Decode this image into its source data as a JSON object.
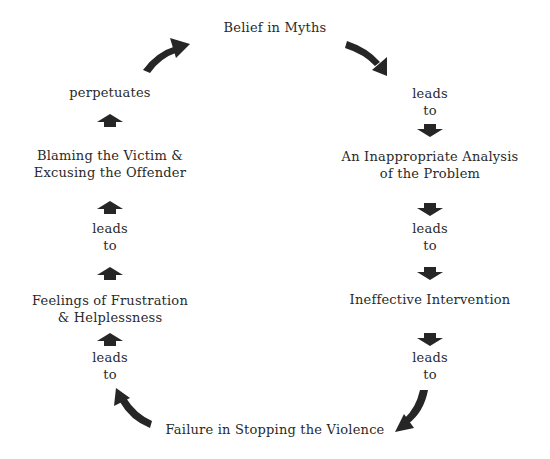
{
  "diagram": {
    "type": "cycle",
    "nodes": [
      {
        "id": "belief",
        "text": "Belief in Myths"
      },
      {
        "id": "analysis",
        "line1": "An Inappropriate Analysis",
        "line2": "of the Problem"
      },
      {
        "id": "intervention",
        "text": "Ineffective Intervention"
      },
      {
        "id": "failure",
        "text": "Failure in Stopping the Violence"
      },
      {
        "id": "frustration",
        "line1": "Feelings of Frustration",
        "line2": "& Helplessness"
      },
      {
        "id": "blaming",
        "line1": "Blaming the Victim &",
        "line2": "Excusing the Offender"
      }
    ],
    "connectors": {
      "right_1": {
        "line1": "leads",
        "line2": "to"
      },
      "right_2": {
        "line1": "leads",
        "line2": "to"
      },
      "right_3": {
        "line1": "leads",
        "line2": "to"
      },
      "left_1": {
        "line1": "leads",
        "line2": "to"
      },
      "left_2": {
        "line1": "leads",
        "line2": "to"
      },
      "top_left": {
        "text": "perpetuates"
      }
    },
    "colors": {
      "arrow": "#262626",
      "text": "#2a2a2a",
      "background": "#ffffff"
    }
  }
}
